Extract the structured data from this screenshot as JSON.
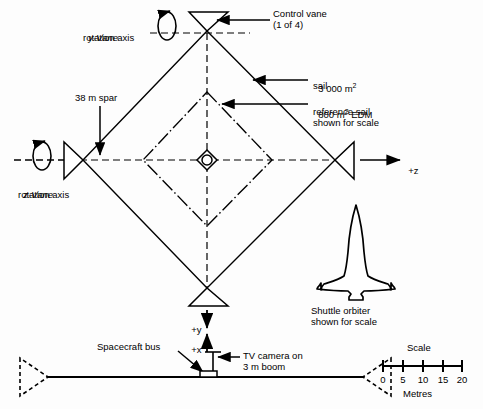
{
  "figure": {
    "title_type": "engineering-line-diagram"
  },
  "labels": {
    "control_vane_l1": "Control vane",
    "control_vane_l2": "(1 of 4)",
    "y_vane_l1": "y-Vane",
    "y_vane_l2": "rotation axis",
    "z_vane_l1": "z-Vane",
    "z_vane_l2": "rotation axis",
    "spar": "38 m spar",
    "sail_l1": "3 000 m",
    "sail_sup": "2",
    "sail_l2": "sail",
    "edm_l1a": "800 m",
    "edm_sup": "2",
    "edm_l1b": " EDM",
    "edm_l2": "reference sail",
    "edm_l3": "shown for scale",
    "axis_z": "+z",
    "axis_y": "+y",
    "axis_x": "+x",
    "spacecraft_bus": "Spacecraft bus",
    "tv_camera_l1": "TV camera on",
    "tv_camera_l2": "3 m boom",
    "shuttle_l1": "Shuttle orbiter",
    "shuttle_l2": "shown for scale"
  },
  "scale_bar": {
    "title": "Scale",
    "units": "Metres",
    "ticks": [
      "0",
      "5",
      "10",
      "15",
      "20"
    ]
  },
  "colors": {
    "ink": "#000000",
    "background": "#fdfdfd"
  }
}
